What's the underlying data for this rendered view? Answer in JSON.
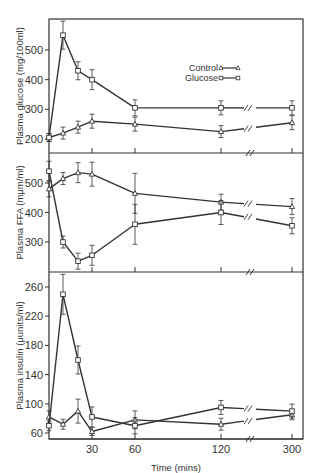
{
  "chart_data": {
    "type": "line",
    "x": [
      0,
      10,
      20,
      30,
      60,
      120,
      300
    ],
    "xlabel": "Time (mins)",
    "xticks": [
      30,
      60,
      120,
      300
    ],
    "x_axis_break": "between 120 and 300",
    "legend": {
      "position": "upper right of top panel",
      "entries": [
        {
          "name": "Control",
          "marker": "triangle"
        },
        {
          "name": "Glucose",
          "marker": "square"
        }
      ]
    },
    "panels": [
      {
        "id": "glucose",
        "ylabel": "Plasma glucose (mg/100ml)",
        "yticks": [
          200,
          300,
          400,
          500
        ],
        "ylim": [
          180,
          590
        ],
        "series": [
          {
            "name": "Control",
            "marker": "triangle",
            "values": [
              205,
              220,
              240,
              260,
              250,
              225,
              255
            ]
          },
          {
            "name": "Glucose",
            "marker": "square",
            "values": [
              205,
              550,
              430,
              400,
              305,
              305,
              305
            ]
          }
        ]
      },
      {
        "id": "ffa",
        "ylabel": "Plasma FFA (mμm/ml)",
        "yticks": [
          300,
          400,
          500
        ],
        "ylim": [
          200,
          600
        ],
        "series": [
          {
            "name": "Control",
            "marker": "triangle",
            "values": [
              480,
              515,
              535,
              530,
              465,
              435,
              420
            ]
          },
          {
            "name": "Glucose",
            "marker": "square",
            "values": [
              540,
              300,
              235,
              255,
              360,
              400,
              355
            ]
          }
        ]
      },
      {
        "id": "insulin",
        "ylabel": "Plasma insulin (μunits/ml)",
        "yticks": [
          60,
          100,
          140,
          180,
          220,
          260
        ],
        "ylim": [
          52,
          288
        ],
        "series": [
          {
            "name": "Control",
            "marker": "triangle",
            "values": [
              82,
              72,
              90,
              62,
              78,
              72,
              85
            ]
          },
          {
            "name": "Glucose",
            "marker": "square",
            "values": [
              70,
              250,
              160,
              82,
              70,
              95,
              90
            ]
          }
        ]
      }
    ]
  },
  "labels": {
    "legend_control": "Control",
    "legend_glucose": "Glucose",
    "xlabel": "Time (mins)",
    "ylabel_glucose": "Plasma glucose (mg/100ml)",
    "ylabel_ffa": "Plasma FFA (mμm/ml)",
    "ylabel_insulin": "Plasma insulin (μunits/ml)"
  },
  "colors": {
    "ink": "#333333",
    "background": "#ffffff"
  }
}
